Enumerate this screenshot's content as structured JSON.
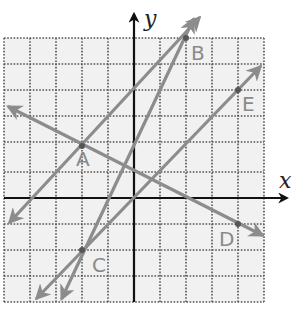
{
  "colors": {
    "background": "#ffffff",
    "grid_fill": "#f1f1f1",
    "grid_line": "#555555",
    "axis": "#111111",
    "line": "#8c8c8c",
    "point": "#555555",
    "label": "#8a8a8a"
  },
  "grid": {
    "x_min": -5,
    "x_max": 5,
    "y_min": -4,
    "y_max": 6,
    "step": 1,
    "style": "dotted"
  },
  "axes": {
    "x_label": "x",
    "y_label": "y"
  },
  "points": [
    {
      "name": "A",
      "x": -2,
      "y": 2
    },
    {
      "name": "B",
      "x": 2,
      "y": 6
    },
    {
      "name": "C",
      "x": -2,
      "y": -2
    },
    {
      "name": "D",
      "x": 4,
      "y": -1
    },
    {
      "name": "E",
      "x": 4,
      "y": 4
    }
  ],
  "lines": [
    {
      "through": [
        "A",
        "B"
      ],
      "equation": "y = x + 4"
    },
    {
      "through": [
        "C",
        "B"
      ],
      "equation": "y = 2x + 2"
    },
    {
      "through": [
        "C",
        "E"
      ],
      "equation": "y = x"
    },
    {
      "through": [
        "A",
        "D"
      ],
      "equation": "y = -x/2 + 1"
    }
  ],
  "labels": {
    "A": "A",
    "B": "B",
    "C": "C",
    "D": "D",
    "E": "E"
  }
}
